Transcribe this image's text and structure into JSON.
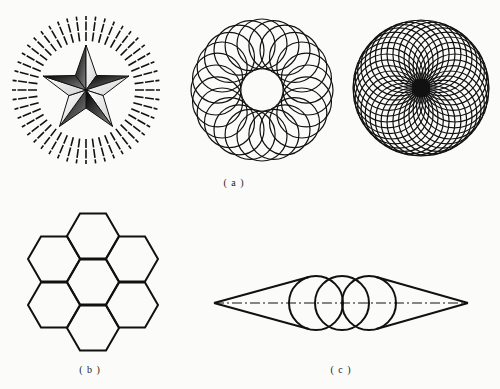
{
  "colors": {
    "background": "#fbfbfa",
    "ink": "#111111",
    "star_dark": "#1a1a1a",
    "star_mid": "#6a6a6a",
    "star_light": "#f4f4f4"
  },
  "captions": {
    "a": "( a )",
    "b": "( b )",
    "c": "( c )"
  },
  "figures": {
    "star_burst": {
      "center": [
        86,
        90
      ],
      "outer_radius": 45,
      "inner_radius": 18,
      "ray_count": 48,
      "ray_inner": 49,
      "ray_outer": 74,
      "rotation_deg": -90
    },
    "rosette_open": {
      "center": [
        262,
        90
      ],
      "circle_count": 24,
      "circle_radius": 25,
      "orbit_radius": 46
    },
    "rosette_dense": {
      "center": [
        421,
        88
      ],
      "circle_count": 36,
      "circle_radius": 34,
      "orbit_radius": 34,
      "center_disc_radius": 9
    },
    "honeycomb": {
      "center": [
        93,
        282
      ],
      "side": 26,
      "cells": [
        [
          0,
          0
        ],
        [
          0,
          -46
        ],
        [
          0,
          46
        ],
        [
          -39,
          -23
        ],
        [
          39,
          -23
        ],
        [
          -39,
          23
        ],
        [
          39,
          23
        ]
      ]
    },
    "tangent_circles": {
      "axis_y": 303,
      "left_tip_x": 214,
      "right_tip_x": 468,
      "circle_radius": 27,
      "circle_centers_x": [
        316,
        342,
        369
      ]
    }
  },
  "caption_positions": {
    "a": [
      234,
      177
    ],
    "b": [
      90,
      364
    ],
    "c": [
      341,
      364
    ]
  }
}
